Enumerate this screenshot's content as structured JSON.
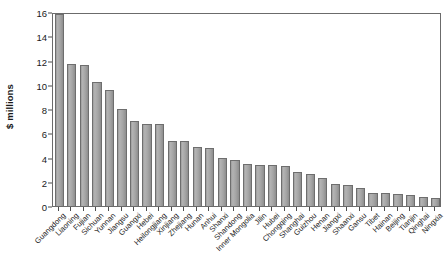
{
  "chart_data": {
    "type": "bar",
    "title": "",
    "xlabel": "",
    "ylabel": "$ millions",
    "ylim": [
      0,
      16
    ],
    "yticks": [
      0,
      2,
      4,
      6,
      8,
      10,
      12,
      14,
      16
    ],
    "ytick_labels": [
      "0",
      "2",
      "4",
      "6",
      "8",
      "10",
      "12",
      "14",
      "16"
    ],
    "grid": false,
    "legend": null,
    "orientation": "vertical",
    "categories": [
      "Guangdong",
      "Liaoning",
      "Fujian",
      "Sichuan",
      "Yunnan",
      "Jiangsu",
      "Guangxi",
      "Hebei",
      "Heilongjiang",
      "Xinjiang",
      "Zhejiang",
      "Hunan",
      "Anhui",
      "Shanxi",
      "Shandong",
      "Inner Mongolia",
      "Jilin",
      "Hubei",
      "Chongqing",
      "Shanghai",
      "Guizhou",
      "Henan",
      "Jiangxi",
      "Shaanxi",
      "Gansu",
      "Tibet",
      "Hainan",
      "Beijing",
      "Tianjin",
      "Qinghai",
      "Ningxia"
    ],
    "values": [
      15.8,
      11.7,
      11.65,
      10.25,
      9.6,
      8.0,
      7.0,
      6.8,
      6.75,
      5.4,
      5.35,
      4.85,
      4.75,
      4.0,
      3.8,
      3.45,
      3.4,
      3.35,
      3.3,
      2.8,
      2.65,
      2.3,
      1.85,
      1.75,
      1.5,
      1.1,
      1.05,
      0.95,
      0.9,
      0.75,
      0.7
    ]
  },
  "style": {
    "bar_fill": "#a8a8a8",
    "bar_edge": "#6e6e6e",
    "axis_color": "#6b6b6b",
    "text_color": "#1a1a1a",
    "background": "#ffffff"
  }
}
